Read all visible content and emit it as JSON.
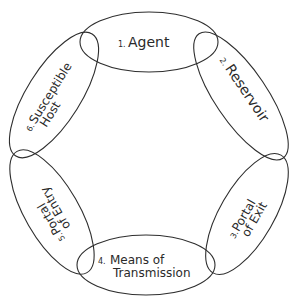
{
  "diagram": {
    "type": "cycle-of-overlapping-ellipses",
    "colors": {
      "stroke": "#2e2e2e",
      "text": "#2a2a2a",
      "background": "#ffffff"
    },
    "links": [
      {
        "id": "agent",
        "number": "1.",
        "lines": [
          "Agent"
        ]
      },
      {
        "id": "reservoir",
        "number": "2.",
        "lines": [
          "Reservoir"
        ]
      },
      {
        "id": "portal-of-exit",
        "number": "3.",
        "lines": [
          "Portal",
          "of Exit"
        ]
      },
      {
        "id": "means-of-transmission",
        "number": "4.",
        "lines": [
          "Means of",
          "Transmission"
        ]
      },
      {
        "id": "portal-of-entry",
        "number": "5.",
        "lines": [
          "Portal",
          "of Entry"
        ]
      },
      {
        "id": "susceptible-host",
        "number": "6.",
        "lines": [
          "Susceptible",
          "Host"
        ]
      }
    ]
  }
}
